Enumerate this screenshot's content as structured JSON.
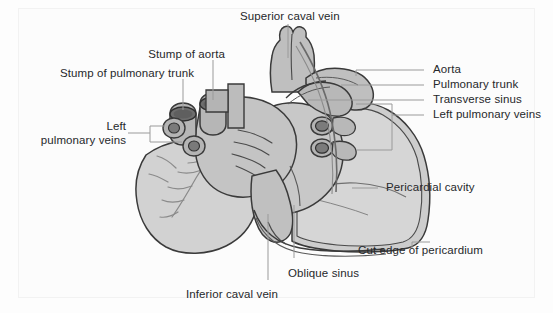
{
  "figure": {
    "type": "anatomical-diagram",
    "background_color": "#fdfdfd",
    "frame_color": "#f2f2f2",
    "ink_color": "#26282b",
    "leader_line_color": "#9a9a9a",
    "palette": {
      "myocardium_light": "#d4d4d4",
      "myocardium_mid": "#bdbdbd",
      "vessel_wall": "#b0b0b0",
      "vessel_lumen_dark": "#6f6f6f",
      "pericardium_fill": "#cfcfcf",
      "outline": "#3a3a3a"
    }
  },
  "labels": {
    "superior_caval_vein": "Superior caval vein",
    "stump_of_aorta": "Stump of aorta",
    "stump_of_pulmonary_trunk": "Stump of pulmonary trunk",
    "left_pulmonary_veins_left": "Left\npulmonary veins",
    "aorta": "Aorta",
    "pulmonary_trunk": "Pulmonary trunk",
    "transverse_sinus": "Transverse sinus",
    "left_pulmonary_veins_right": "Left pulmonary veins",
    "pericardial_cavity": "Pericardial cavity",
    "cut_edge_of_pericardium": "Cut edge of pericardium",
    "oblique_sinus": "Oblique sinus",
    "inferior_caval_vein": "Inferior caval vein"
  }
}
